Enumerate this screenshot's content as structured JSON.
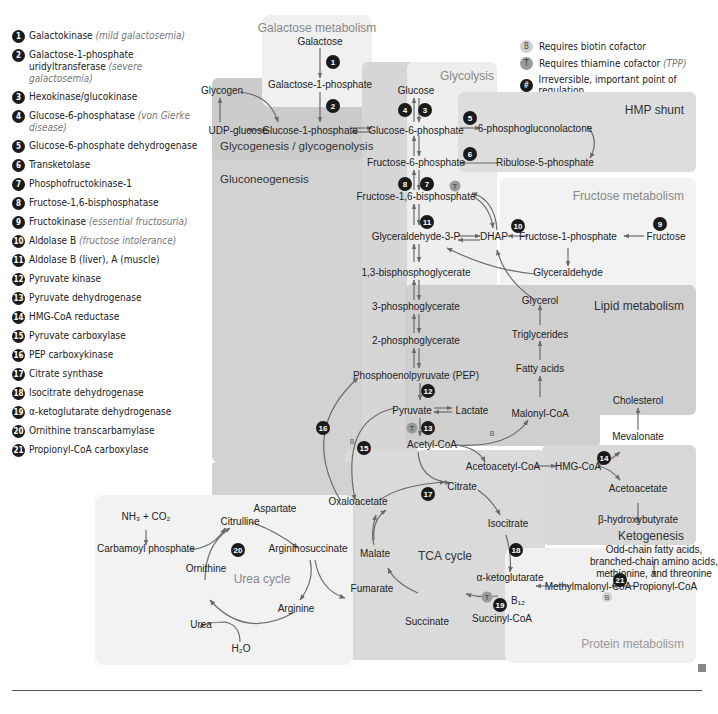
{
  "legend": [
    {
      "num": "1",
      "label": "Galactokinase",
      "note": "(mild galactosemia)"
    },
    {
      "num": "2",
      "label": "Galactose-1-phosphate uridyltransferase",
      "note": "(severe galactosemia)"
    },
    {
      "num": "3",
      "label": "Hexokinase/glucokinase",
      "note": ""
    },
    {
      "num": "4",
      "label": "Glucose-6-phosphatase",
      "note": "(von Gierke disease)"
    },
    {
      "num": "5",
      "label": "Glucose-6-phosphate dehydrogenase",
      "note": ""
    },
    {
      "num": "6",
      "label": "Transketolase",
      "note": ""
    },
    {
      "num": "7",
      "label": "Phosphofructokinase-1",
      "note": ""
    },
    {
      "num": "8",
      "label": "Fructose-1,6-bisphosphatase",
      "note": ""
    },
    {
      "num": "9",
      "label": "Fructokinase",
      "note": "(essential fructosuria)"
    },
    {
      "num": "10",
      "label": "Aldolase B",
      "note": "(fructose intolerance)"
    },
    {
      "num": "11",
      "label": "Aldolase B (liver), A (muscle)",
      "note": ""
    },
    {
      "num": "12",
      "label": "Pyruvate kinase",
      "note": ""
    },
    {
      "num": "13",
      "label": "Pyruvate dehydrogenase",
      "note": ""
    },
    {
      "num": "14",
      "label": "HMG-CoA reductase",
      "note": ""
    },
    {
      "num": "15",
      "label": "Pyruvate carboxylase",
      "note": ""
    },
    {
      "num": "16",
      "label": "PEP carboxykinase",
      "note": ""
    },
    {
      "num": "17",
      "label": "Citrate synthase",
      "note": ""
    },
    {
      "num": "18",
      "label": "Isocitrate dehydrogenase",
      "note": ""
    },
    {
      "num": "19",
      "label": "α-ketoglutarate dehydrogenase",
      "note": ""
    },
    {
      "num": "20",
      "label": "Ornithine transcarbamylase",
      "note": ""
    },
    {
      "num": "21",
      "label": "Propionyl-CoA carboxylase",
      "note": ""
    }
  ],
  "key": {
    "b": {
      "symbol": "B",
      "label": "Requires biotin cofactor"
    },
    "t": {
      "symbol": "T",
      "label": "Requires thiamine cofactor",
      "note": "(TPP)"
    },
    "h": {
      "symbol": "#",
      "label": "Irreversible, important point of regulation"
    }
  },
  "regions": {
    "galactose": "Galactose metabolism",
    "glycolysis": "Glycolysis",
    "hmp": "HMP shunt",
    "glycogen": "Glycogenesis / glycogenolysis",
    "gluconeo": "Gluconeogenesis",
    "fructose": "Fructose metabolism",
    "lipid": "Lipid metabolism",
    "ketogenesis": "Ketogenesis",
    "urea": "Urea cycle",
    "tca": "TCA cycle",
    "protein": "Protein metabolism"
  },
  "nodes": {
    "galactose": "Galactose",
    "gal1p": "Galactose-1-phosphate",
    "glycogen": "Glycogen",
    "udpglucose": "UDP-glucose",
    "glc1p": "Glucose-1-phosphate",
    "glucose": "Glucose",
    "g6p": "Glucose-6-phosphate",
    "pgl": "6-phosphogluconolactone",
    "ru5p": "Ribulose-5-phosphate",
    "f6p": "Fructose-6-phosphate",
    "f16bp": "Fructose-1,6-bisphosphate",
    "g3p": "Glyceraldehyde-3-P",
    "dhap": "DHAP",
    "f1p": "Fructose-1-phosphate",
    "fructose": "Fructose",
    "glyceraldehyde": "Glyceraldehyde",
    "bpg": "1,3-bisphosphoglycerate",
    "pg3": "3-phosphoglycerate",
    "pg2": "2-phosphoglycerate",
    "pep": "Phosphoenolpyruvate (PEP)",
    "pyruvate": "Pyruvate",
    "lactate": "Lactate",
    "glycerol": "Glycerol",
    "tg": "Triglycerides",
    "fa": "Fatty acids",
    "malonyl": "Malonyl-CoA",
    "acetylcoa": "Acetyl-CoA",
    "acetoacetylcoa": "Acetoacetyl-CoA",
    "hmgcoa": "HMG-CoA",
    "cholesterol": "Cholesterol",
    "mevalonate": "Mevalonate",
    "acetoacetate": "Acetoacetate",
    "bhb": "β-hydroxybutyrate",
    "oaa": "Oxaloacetate",
    "citrate": "Citrate",
    "isocitrate": "Isocitrate",
    "akg": "α-ketoglutarate",
    "succoa": "Succinyl-CoA",
    "succinate": "Succinate",
    "fumarate": "Fumarate",
    "malate": "Malate",
    "nh3co2": "NH₃ + CO₂",
    "carbamoyl": "Carbamoyl phosphate",
    "citrulline": "Citrulline",
    "aspartate": "Aspartate",
    "argsucc": "Argininosuccinate",
    "arginine": "Arginine",
    "ornithine": "Ornithine",
    "urea": "Urea",
    "h2o": "H₂O",
    "oddchain1": "Odd-chain fatty acids,",
    "oddchain2": "branched-chain amino acids,",
    "oddchain3": "methionine, and threonine",
    "propionyl": "Propionyl-CoA",
    "methylmalonyl": "Methylmalonyl-CoA",
    "b12": "B₁₂"
  },
  "cofactors": {
    "b": "B",
    "t": "T"
  },
  "enzymes": {
    "e1": "1",
    "e2": "2",
    "e3": "3",
    "e4": "4",
    "e5": "5",
    "e6": "6",
    "e7": "7",
    "e8": "8",
    "e9": "9",
    "e10": "10",
    "e11": "11",
    "e12": "12",
    "e13": "13",
    "e14": "14",
    "e15": "15",
    "e16": "16",
    "e17": "17",
    "e18": "18",
    "e19": "19",
    "e20": "20",
    "e21": "21"
  }
}
